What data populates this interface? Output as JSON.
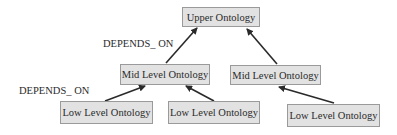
{
  "diagram": {
    "nodes": [
      {
        "id": "upper",
        "label": "Upper Ontology"
      },
      {
        "id": "mid_left",
        "label": "Mid Level Ontology"
      },
      {
        "id": "mid_right",
        "label": "Mid Level Ontology"
      },
      {
        "id": "low_1",
        "label": "Low Level Ontology"
      },
      {
        "id": "low_2",
        "label": "Low Level Ontology"
      },
      {
        "id": "low_3",
        "label": "Low Level Ontology"
      }
    ],
    "edges": [
      {
        "from": "mid_left",
        "to": "upper",
        "label": "DEPENDS_ ON"
      },
      {
        "from": "mid_right",
        "to": "upper",
        "label": ""
      },
      {
        "from": "low_1",
        "to": "mid_left",
        "label": "DEPENDS_ ON"
      },
      {
        "from": "low_2",
        "to": "mid_left",
        "label": ""
      },
      {
        "from": "low_3",
        "to": "mid_right",
        "label": ""
      }
    ],
    "edge_labels": {
      "top": "DEPENDS_ ON",
      "bottom": "DEPENDS_ ON"
    },
    "colors": {
      "box_fill": "#e2e2e2",
      "box_border": "#9a9a9a",
      "arrow": "#2a2a2a",
      "text": "#2a2a2a"
    }
  }
}
